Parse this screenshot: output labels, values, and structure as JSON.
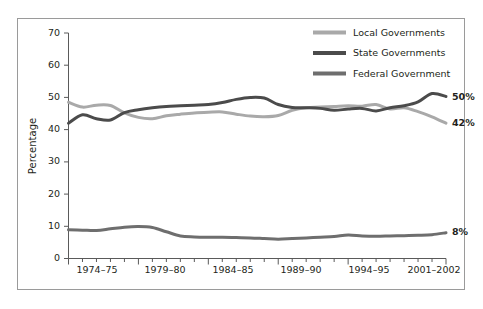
{
  "chart_data": {
    "type": "line",
    "title": "",
    "subtitle": "",
    "xlabel": "",
    "ylabel": "Percentage",
    "ylim": [
      0,
      70
    ],
    "yticks": [
      0,
      10,
      20,
      30,
      40,
      50,
      60,
      70
    ],
    "ytick_labels": [
      "0",
      "10",
      "20",
      "30",
      "40",
      "50",
      "60",
      "70"
    ],
    "grid": false,
    "legend_position": "top-right",
    "x_start_year": 1974,
    "x_end_year": 2001,
    "xtick_labels": [
      "1974–75",
      "1979–80",
      "1984–85",
      "1989–90",
      "1994–95",
      "2001–2002"
    ],
    "xtick_years": [
      1974,
      1979,
      1984,
      1989,
      1994,
      2001
    ],
    "x": [
      1974,
      1975,
      1976,
      1977,
      1978,
      1979,
      1980,
      1981,
      1982,
      1983,
      1984,
      1985,
      1986,
      1987,
      1988,
      1989,
      1990,
      1991,
      1992,
      1993,
      1994,
      1995,
      1996,
      1997,
      1998,
      1999,
      2000,
      2001
    ],
    "series": [
      {
        "name": "Local Governments",
        "color": "#a9a9a9",
        "end_label": "42%",
        "end_value": 42,
        "values": [
          48.5,
          47.0,
          47.6,
          47.5,
          45.2,
          43.8,
          43.4,
          44.3,
          44.8,
          45.2,
          45.4,
          45.5,
          44.8,
          44.2,
          44.0,
          44.4,
          46.0,
          46.8,
          47.0,
          47.2,
          47.4,
          47.3,
          47.8,
          46.4,
          46.8,
          45.6,
          44.0,
          42.0
        ]
      },
      {
        "name": "State Governments",
        "color": "#4b4b4b",
        "end_label": "50%",
        "end_value": 50,
        "values": [
          42.0,
          44.6,
          43.4,
          43.0,
          45.3,
          46.2,
          46.8,
          47.2,
          47.4,
          47.6,
          47.8,
          48.4,
          49.4,
          50.0,
          49.8,
          47.8,
          46.9,
          46.8,
          46.6,
          46.0,
          46.4,
          46.6,
          45.8,
          46.8,
          47.4,
          48.6,
          51.2,
          50.3
        ]
      },
      {
        "name": "Federal Government",
        "color": "#6e6e6e",
        "end_label": "8%",
        "end_value": 8,
        "values": [
          8.9,
          8.8,
          8.7,
          9.2,
          9.7,
          9.9,
          9.6,
          8.3,
          7.0,
          6.7,
          6.6,
          6.6,
          6.5,
          6.4,
          6.2,
          6.0,
          6.2,
          6.4,
          6.6,
          6.8,
          7.3,
          7.0,
          6.9,
          7.0,
          7.1,
          7.2,
          7.4,
          8.0
        ]
      }
    ]
  },
  "legend": {
    "items": [
      {
        "label": "Local Governments",
        "color": "#a9a9a9"
      },
      {
        "label": "State Governments",
        "color": "#4b4b4b"
      },
      {
        "label": "Federal Government",
        "color": "#6e6e6e"
      }
    ]
  },
  "axes": {
    "y_axis_title": "Percentage",
    "y_tick_0": "0",
    "y_tick_10": "10",
    "y_tick_20": "20",
    "y_tick_30": "30",
    "y_tick_40": "40",
    "y_tick_50": "50",
    "y_tick_60": "60",
    "y_tick_70": "70",
    "x_tick_1": "1974–75",
    "x_tick_2": "1979–80",
    "x_tick_3": "1984–85",
    "x_tick_4": "1989–90",
    "x_tick_5": "1994–95",
    "x_tick_6": "2001–2002"
  },
  "end_labels": {
    "state": "50%",
    "local": "42%",
    "federal": "8%"
  }
}
